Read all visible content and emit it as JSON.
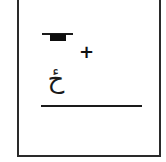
{
  "card": {
    "symbols": {
      "plus": "+",
      "letter": "ځ"
    },
    "colors": {
      "ink": "#1a1a1a",
      "background": "#ffffff",
      "border": "#2a2a2a"
    }
  }
}
